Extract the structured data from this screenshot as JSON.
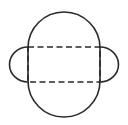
{
  "diagram": {
    "type": "geometric-outline",
    "stroke_color": "#2a2a2a",
    "background_color": "#ffffff",
    "stroke_width": 1.6,
    "body": {
      "shape": "stadium",
      "left": 28,
      "right": 100,
      "top": 12,
      "bottom": 117,
      "cap_radius": 36
    },
    "dashed_rect": {
      "x": 28,
      "y": 47,
      "width": 72,
      "height": 35,
      "dash": "6 3.5"
    },
    "side_tabs": [
      {
        "side": "left",
        "cx": 28,
        "cy": 64.5,
        "r": 18.5
      },
      {
        "side": "right",
        "cx": 100,
        "cy": 64.5,
        "r": 18.5
      }
    ]
  }
}
